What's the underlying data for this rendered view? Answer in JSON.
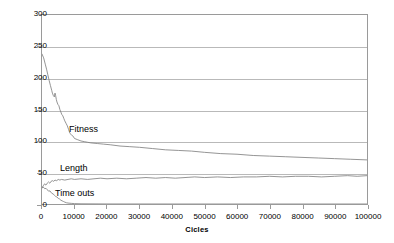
{
  "chart_data": {
    "type": "line",
    "title": "",
    "xlabel": "Cicles",
    "ylabel": "",
    "xlim": [
      0,
      100000
    ],
    "ylim": [
      0,
      300
    ],
    "grid": "horizontal",
    "legend_position": "inline-annotations",
    "x_ticks": [
      "0",
      "10000",
      "20000",
      "30000",
      "40000",
      "50000",
      "60000",
      "70000",
      "80000",
      "90000",
      "100000"
    ],
    "x_tick_values": [
      0,
      10000,
      20000,
      30000,
      40000,
      50000,
      60000,
      70000,
      80000,
      90000,
      100000
    ],
    "y_ticks": [
      "0",
      "50",
      "100",
      "150",
      "200",
      "250",
      "300"
    ],
    "y_tick_values": [
      0,
      50,
      100,
      150,
      200,
      250,
      300
    ],
    "annotations": [
      {
        "text": "Fitness",
        "x": 12000,
        "y": 118
      },
      {
        "text": "Length",
        "x": 9000,
        "y": 56
      },
      {
        "text": "Time outs",
        "x": 7000,
        "y": 28
      }
    ],
    "series": [
      {
        "name": "Fitness",
        "color": "#7a7a7a",
        "x": [
          0,
          500,
          1000,
          1400,
          1800,
          2200,
          2600,
          3000,
          3200,
          3500,
          3800,
          4000,
          4200,
          4400,
          4600,
          4900,
          5200,
          5500,
          5800,
          6100,
          6400,
          6700,
          7000,
          7400,
          7800,
          8200,
          8600,
          9000,
          9500,
          10000,
          11000,
          12000,
          13000,
          14000,
          15000,
          17000,
          19000,
          21000,
          24000,
          27000,
          30000,
          34000,
          38000,
          42000,
          46000,
          50000,
          55000,
          60000,
          65000,
          70000,
          75000,
          80000,
          85000,
          90000,
          95000,
          100000
        ],
        "y": [
          238,
          232,
          222,
          214,
          205,
          196,
          188,
          180,
          176,
          172,
          170,
          176,
          172,
          166,
          162,
          158,
          156,
          150,
          146,
          142,
          140,
          136,
          132,
          128,
          124,
          118,
          112,
          110,
          108,
          104,
          102,
          100,
          99,
          98,
          97,
          96,
          95,
          94,
          92,
          91,
          90,
          88,
          86,
          85,
          84,
          82,
          80,
          79,
          77,
          76,
          75,
          74,
          73,
          72,
          71,
          70
        ]
      },
      {
        "name": "Length",
        "color": "#7a7a7a",
        "x": [
          0,
          400,
          800,
          1200,
          1600,
          2000,
          2400,
          2800,
          3200,
          3600,
          4000,
          4500,
          5000,
          5500,
          6000,
          7000,
          8000,
          9000,
          10000,
          12000,
          14000,
          16000,
          18000,
          20000,
          23000,
          26000,
          29000,
          32000,
          35000,
          38000,
          41000,
          44000,
          47000,
          50000,
          54000,
          58000,
          62000,
          66000,
          70000,
          74000,
          78000,
          82000,
          86000,
          90000,
          94000,
          97000,
          100000
        ],
        "y": [
          26,
          29,
          32,
          30,
          33,
          35,
          33,
          36,
          37,
          36,
          38,
          37,
          39,
          38,
          39,
          38,
          39,
          40,
          39,
          40,
          39,
          40,
          41,
          40,
          41,
          40,
          41,
          42,
          41,
          42,
          41,
          42,
          43,
          42,
          43,
          42,
          43,
          43,
          44,
          43,
          44,
          44,
          43,
          44,
          45,
          44,
          45
        ]
      },
      {
        "name": "Time outs",
        "color": "#7a7a7a",
        "x": [
          0,
          300,
          600,
          900,
          1200,
          1500,
          1800,
          2100,
          2400,
          2700,
          3000,
          3400,
          3800,
          4200,
          4600,
          5000,
          5400,
          5800,
          6200,
          6600,
          7000,
          7500,
          8000,
          9000,
          10000,
          12000,
          20000,
          40000,
          70000,
          100000
        ],
        "y": [
          25,
          27,
          26,
          24,
          25,
          23,
          22,
          20,
          21,
          19,
          17,
          16,
          14,
          12,
          11,
          9,
          8,
          6,
          5,
          4,
          3,
          2,
          1.5,
          1,
          0.6,
          0.3,
          0.1,
          0,
          0,
          0
        ]
      }
    ]
  }
}
